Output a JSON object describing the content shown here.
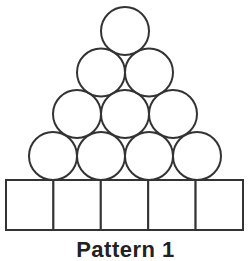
{
  "figure": {
    "caption": "Pattern 1",
    "stroke_color": "#333333",
    "fill_color": "#ffffff",
    "stroke_width": 2,
    "circle_radius": 24,
    "circle_rows": [
      {
        "count": 1,
        "cy": 31,
        "cx": [
          125
        ]
      },
      {
        "count": 2,
        "cy": 72.5,
        "cx": [
          101,
          149
        ]
      },
      {
        "count": 3,
        "cy": 114,
        "cx": [
          77,
          125,
          173
        ]
      },
      {
        "count": 4,
        "cy": 156,
        "cx": [
          53,
          101,
          149,
          197
        ]
      }
    ],
    "base": {
      "x": 6,
      "y": 180,
      "width": 237,
      "height": 50,
      "cell_count": 5
    }
  }
}
